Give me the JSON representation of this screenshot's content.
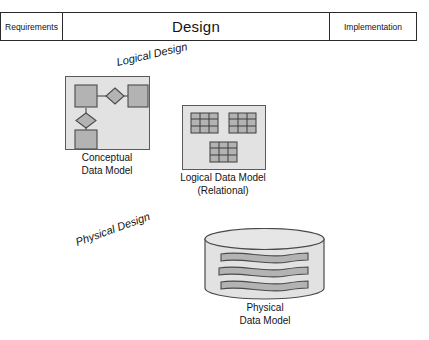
{
  "figure": {
    "background_color": "#ffffff"
  },
  "phase_bar": {
    "cells": [
      {
        "label": "Requirements",
        "emphasis": "small"
      },
      {
        "label": "Design",
        "emphasis": "large"
      },
      {
        "label": "Implementation",
        "emphasis": "small"
      }
    ],
    "border_color": "#2b2b2b"
  },
  "step_labels": [
    {
      "name": "logical-design",
      "text": "Logical Design",
      "rotation_deg": -13
    },
    {
      "name": "physical-design",
      "text": "Physical Design",
      "rotation_deg": -20
    }
  ],
  "models": [
    {
      "name": "conceptual-data-model",
      "caption_lines": [
        "Conceptual",
        "Data Model"
      ],
      "panel_fill": "#e2e2e2",
      "panel_stroke": "#5a5a5a",
      "shape_fill": "#b3b3b3",
      "shape_stroke": "#4a4a4a",
      "notation": "entity-relationship",
      "entities": 3,
      "relationships": 2
    },
    {
      "name": "logical-data-model",
      "caption_lines": [
        "Logical Data Model",
        "(Relational)"
      ],
      "panel_fill": "#e2e2e2",
      "panel_stroke": "#5a5a5a",
      "shape_fill": "#b3b3b3",
      "shape_stroke": "#3d3d3d",
      "notation": "relational-tables",
      "tables": 3,
      "table_grid": {
        "columns": 3,
        "rows": 3
      }
    },
    {
      "name": "physical-data-model",
      "caption_lines": [
        "Physical",
        "Data Model"
      ],
      "panel_fill": "#e2e2e2",
      "panel_stroke": "#4a4a4a",
      "shape_fill": "#b3b3b3",
      "shape_stroke": "#4a4a4a",
      "notation": "database-cylinder",
      "stored_bands": 3
    }
  ]
}
